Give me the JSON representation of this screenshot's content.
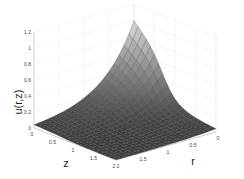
{
  "chart_data": {
    "type": "surface",
    "title": "",
    "xlabel": "z",
    "ylabel": "r",
    "zlabel": "u(r,z)",
    "x_ticks": [
      "0",
      "0.5",
      "1",
      "1.5",
      "2"
    ],
    "y_ticks": [
      "0",
      "0.5",
      "1",
      "1.5",
      "2"
    ],
    "z_ticks": [
      "0",
      "0.2",
      "0.4",
      "0.6",
      "0.8",
      "1",
      "1.2"
    ],
    "xlim": [
      0,
      2
    ],
    "ylim": [
      0,
      2
    ],
    "zlim": [
      0,
      1.2
    ],
    "grid": true,
    "colormap": "gray",
    "surface_description": "u peaks at about 1.0 along r=0 (plateau across z near 0..0.6) and decays toward 0 as r and z increase",
    "surface_grid": {
      "x": [
        0,
        0.1,
        0.2,
        0.3,
        0.4,
        0.5,
        0.6,
        0.7,
        0.8,
        0.9,
        1.0,
        1.1,
        1.2,
        1.3,
        1.4,
        1.5,
        1.6,
        1.7,
        1.8,
        1.9,
        2.0
      ],
      "y": [
        0,
        0.1,
        0.2,
        0.3,
        0.4,
        0.5,
        0.6,
        0.7,
        0.8,
        0.9,
        1.0,
        1.1,
        1.2,
        1.3,
        1.4,
        1.5,
        1.6,
        1.7,
        1.8,
        1.9,
        2.0
      ]
    }
  }
}
